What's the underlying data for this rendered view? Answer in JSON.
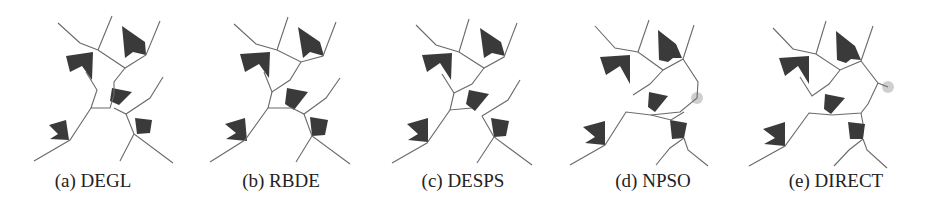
{
  "figure": {
    "panels": [
      {
        "id": "a",
        "label": "(a) DEGL",
        "method": "DEGL"
      },
      {
        "id": "b",
        "label": "(b) RBDE",
        "method": "RBDE"
      },
      {
        "id": "c",
        "label": "(c) DESPS",
        "method": "DESPS"
      },
      {
        "id": "d",
        "label": "(d) NPSO",
        "method": "NPSO"
      },
      {
        "id": "e",
        "label": "(e) DIRECT",
        "method": "DIRECT"
      }
    ]
  }
}
